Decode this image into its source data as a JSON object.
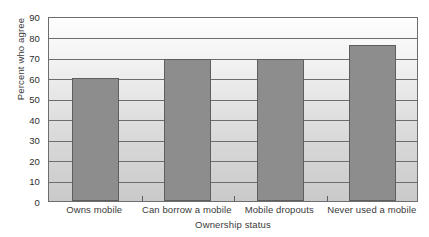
{
  "chart_data": {
    "type": "bar",
    "title": "",
    "xlabel": "Ownership status",
    "ylabel": "Percent who agree",
    "categories": [
      "Owns mobile",
      "Can borrow a mobile",
      "Mobile dropouts",
      "Never used a mobile"
    ],
    "values": [
      60,
      69,
      69,
      76
    ],
    "ylim": [
      0,
      90
    ],
    "ytick_labels": [
      "0",
      "10",
      "20",
      "30",
      "40",
      "50",
      "60",
      "70",
      "80",
      "90"
    ],
    "ytick_values": [
      0,
      10,
      20,
      30,
      40,
      50,
      60,
      70,
      80,
      90
    ],
    "grid": true,
    "legend": false,
    "bar_color": "#8d8d8d",
    "bar_edge_color": "#5e5e5e",
    "plot_border_color": "#6d6d6d",
    "gridline_color": "#6d6d6d",
    "background_color": "#ffffff",
    "text_color": "#3a3a3a"
  }
}
